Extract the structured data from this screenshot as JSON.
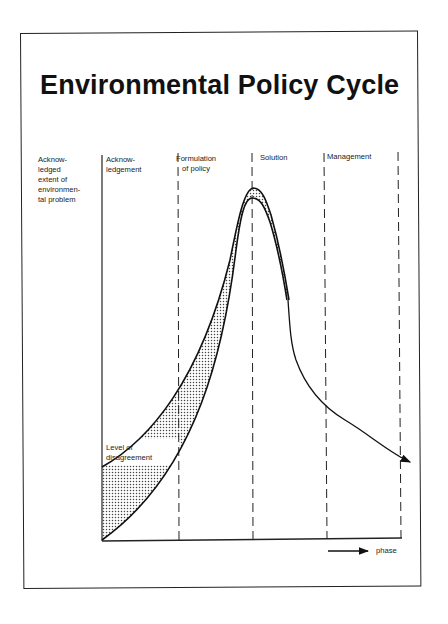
{
  "title": "Environmental Policy Cycle",
  "y_axis_label": "Acknow-\nledged\nextent of\nenvironmen-\ntal problem",
  "phases": [
    {
      "label": "Acknow-\nledgement"
    },
    {
      "label": "Formulation\nof policy"
    },
    {
      "label": "Solution"
    },
    {
      "label": "Management"
    }
  ],
  "shaded_region_label": "Level of\ndisagreement",
  "x_axis_label": "phase",
  "colors": {
    "line": "#111111",
    "background": "#ffffff",
    "shading": "#555555"
  }
}
